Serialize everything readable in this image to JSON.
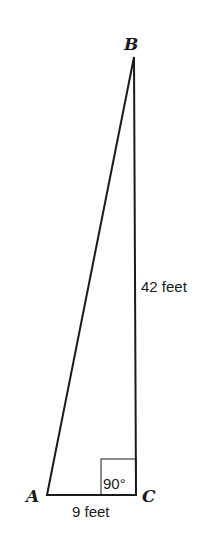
{
  "diagram": {
    "type": "right-triangle",
    "vertices": {
      "A": {
        "label": "A"
      },
      "B": {
        "label": "B"
      },
      "C": {
        "label": "C"
      }
    },
    "sides": {
      "vertical": {
        "label": "42 feet",
        "from": "C",
        "to": "B"
      },
      "horizontal": {
        "label": "9 feet",
        "from": "A",
        "to": "C"
      }
    },
    "right_angle": {
      "label": "90°",
      "vertex": "C"
    },
    "colors": {
      "stroke": "#1a1a1a",
      "background": "#ffffff"
    }
  }
}
